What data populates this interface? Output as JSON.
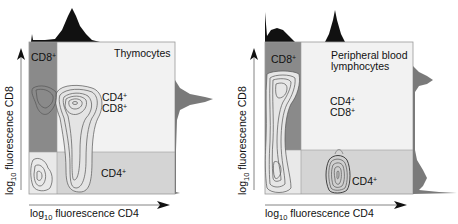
{
  "figure": {
    "panels": [
      {
        "id": "thymocytes",
        "title": "Thymocytes",
        "quadrant_labels": {
          "cd8": {
            "base": "CD8",
            "sup": "+"
          },
          "cd4cd8_line1": {
            "base": "CD4",
            "sup": "+"
          },
          "cd4cd8_line2": {
            "base": "CD8",
            "sup": "+"
          },
          "cd4": {
            "base": "CD4",
            "sup": "+"
          }
        },
        "x_axis": {
          "prefix": "log",
          "sub": "10",
          "label": " fluorescence  CD4"
        },
        "y_axis": {
          "prefix": "log",
          "sub": "10",
          "label": " fluorescence  CD8"
        }
      },
      {
        "id": "peripheral-blood",
        "title_line1": "Peripheral blood",
        "title_line2": "lymphocytes",
        "quadrant_labels": {
          "cd8": {
            "base": "CD8",
            "sup": "+"
          },
          "cd4cd8_line1": {
            "base": "CD4",
            "sup": "+"
          },
          "cd4cd8_line2": {
            "base": "CD8",
            "sup": "+"
          },
          "cd4": {
            "base": "CD4",
            "sup": "+"
          }
        },
        "x_axis": {
          "prefix": "log",
          "sub": "10",
          "label": " fluorescence  CD4"
        },
        "y_axis": {
          "prefix": "log",
          "sub": "10",
          "label": " fluorescence  CD8"
        }
      }
    ],
    "colors": {
      "cd8_quadrant": "#8a8a8a",
      "double_positive_quadrant": "#f2f2f2",
      "cd4_quadrant": "#d4d4d4",
      "double_negative_quadrant": "#e9e9e9",
      "histogram_top": "#111111",
      "histogram_side": "#7a7a7a",
      "contour": "#555555",
      "frame": "#9a9a9a"
    }
  }
}
